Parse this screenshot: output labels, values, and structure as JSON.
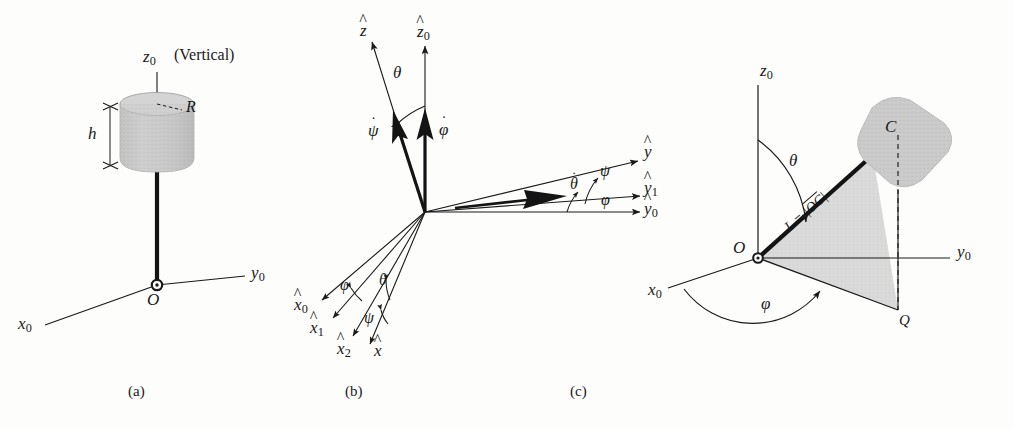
{
  "figure": {
    "background_color": "#fdfdfc",
    "ink_color": "#1a1a1a",
    "body_fill": "#c9c9c9",
    "plane_fill": "#d9d9d9"
  },
  "panels": [
    {
      "id": "a",
      "caption": "(a)",
      "description": "Cylindrical body of radius R and height h on a rigid massless rod pivoted at O",
      "labels": {
        "z_axis": "z",
        "z_axis_sub": "0",
        "vertical_note": "(Vertical)",
        "radius": "R",
        "height": "h",
        "origin": "O",
        "y_axis": "y",
        "y_axis_sub": "0",
        "x_axis": "x",
        "x_axis_sub": "0"
      }
    },
    {
      "id": "b",
      "caption": "(b)",
      "description": "Euler angle frame fan showing successive rotations phi, theta, psi and angular rate vectors",
      "labels": {
        "z_hat": "z",
        "z0_hat": "z",
        "z0_hat_sub": "0",
        "theta_top": "θ",
        "psi_dot": "ψ",
        "phi_dot": "φ",
        "theta_dot": "θ",
        "y_hat": "y",
        "y1_hat": "y",
        "y1_hat_sub": "1",
        "y0_hat": "y",
        "y0_hat_sub": "0",
        "psi_right": "ψ",
        "phi_right": "φ",
        "x0_hat": "x",
        "x0_hat_sub": "0",
        "x1_hat": "x",
        "x1_hat_sub": "1",
        "x2_hat": "x",
        "x2_hat_sub": "2",
        "x_hat": "x",
        "phi_left": "φ",
        "theta_left": "θ",
        "psi_left": "ψ"
      }
    },
    {
      "id": "c",
      "caption": "(c)",
      "description": "Spherical coordinates of the body center C with rod length L equal to distance O to C",
      "labels": {
        "z_axis": "z",
        "z_axis_sub": "0",
        "theta": "θ",
        "length": "L = |OC|",
        "length_symbol": "L",
        "length_equals": " = |",
        "length_bar": "OC",
        "length_close": "|",
        "center": "C",
        "origin": "O",
        "y_axis": "y",
        "y_axis_sub": "0",
        "x_axis": "x",
        "x_axis_sub": "0",
        "phi": "φ",
        "projection": "Q"
      }
    }
  ]
}
